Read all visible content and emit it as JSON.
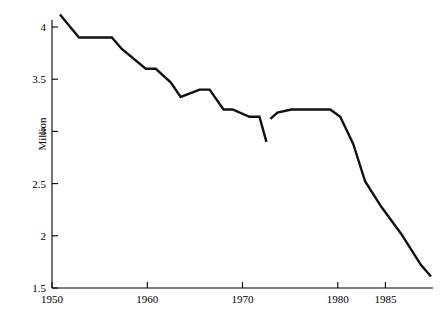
{
  "chart_data": {
    "type": "line",
    "title": "",
    "xlabel": "",
    "ylabel": "Million",
    "xlim": [
      1950,
      1988.2
    ],
    "ylim": [
      1.5,
      4.2
    ],
    "grid": false,
    "legend": null,
    "x_ticks": [
      1950,
      1960,
      1970,
      1980,
      1985
    ],
    "x_tick_labels": [
      "1950",
      "1960",
      "1970",
      "1980",
      "1985"
    ],
    "y_ticks": [
      1.5,
      2,
      2.5,
      3,
      3.5,
      4
    ],
    "y_tick_labels": [
      "1.5",
      "2",
      "2.5",
      "3",
      "3.5",
      "4"
    ],
    "series": [
      {
        "name": "segment-1",
        "x": [
          1950.8,
          1952.7,
          1953.6,
          1956.0,
          1957.0,
          1959.4,
          1960.4,
          1961.9,
          1962.9,
          1964.8,
          1965.8,
          1967.2,
          1968.1,
          1969.8,
          1970.8,
          1971.5
        ],
        "y": [
          4.12,
          3.9,
          3.9,
          3.9,
          3.79,
          3.6,
          3.6,
          3.47,
          3.33,
          3.4,
          3.4,
          3.21,
          3.21,
          3.14,
          3.14,
          2.9
        ]
      },
      {
        "name": "segment-2",
        "x": [
          1971.9,
          1972.6,
          1974.0,
          1977.9,
          1978.9,
          1980.2,
          1981.4,
          1983.0,
          1985.0,
          1987.0,
          1988.0
        ],
        "y": [
          3.12,
          3.18,
          3.21,
          3.21,
          3.14,
          2.88,
          2.52,
          2.28,
          2.02,
          1.72,
          1.61
        ]
      }
    ],
    "line_color": "#111111",
    "axis_color": "#000000",
    "background_color": "#ffffff"
  },
  "figure": {
    "y_axis_title": "Million",
    "ticks_y": {
      "t0": "1.5",
      "t1": "2",
      "t2": "2.5",
      "t3": "3",
      "t4": "3.5",
      "t5": "4"
    },
    "ticks_x": {
      "t0": "1950",
      "t1": "1960",
      "t2": "1970",
      "t3": "1980",
      "t4": "1985"
    }
  }
}
